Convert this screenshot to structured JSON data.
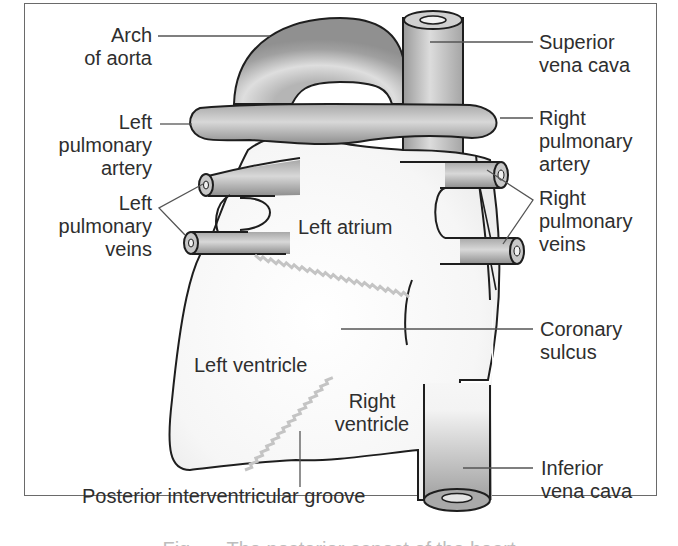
{
  "figure": {
    "labels": {
      "arch_of_aorta": "Arch\nof aorta",
      "arch_line1": "Arch",
      "arch_line2": "of aorta",
      "superior_vena_cava_line1": "Superior",
      "superior_vena_cava_line2": "vena cava",
      "left_pulmonary_artery_line1": "Left",
      "left_pulmonary_artery_line2": "pulmonary",
      "left_pulmonary_artery_line3": "artery",
      "right_pulmonary_artery_line1": "Right",
      "right_pulmonary_artery_line2": "pulmonary",
      "right_pulmonary_artery_line3": "artery",
      "left_pulmonary_veins_line1": "Left",
      "left_pulmonary_veins_line2": "pulmonary",
      "left_pulmonary_veins_line3": "veins",
      "right_pulmonary_veins_line1": "Right",
      "right_pulmonary_veins_line2": "pulmonary",
      "right_pulmonary_veins_line3": "veins",
      "left_atrium": "Left atrium",
      "left_ventricle": "Left ventricle",
      "right_ventricle_line1": "Right",
      "right_ventricle_line2": "ventricle",
      "coronary_sulcus_line1": "Coronary",
      "coronary_sulcus_line2": "sulcus",
      "inferior_vena_cava_line1": "Inferior",
      "inferior_vena_cava_line2": "vena cava",
      "posterior_interventricular_groove": "Posterior interventricular groove"
    },
    "caption_partial": "Fig. — The posterior aspect of the heart",
    "colors": {
      "outline": "#1e1e1e",
      "vessel_dark": "#8a8a8a",
      "vessel_light": "#d9d9d9",
      "heart_fill": "#f4f4f4",
      "groove": "#c8c8c8",
      "leader_line": "#555555",
      "text": "#2e2e2e",
      "frame": "#6a6a6a"
    }
  }
}
